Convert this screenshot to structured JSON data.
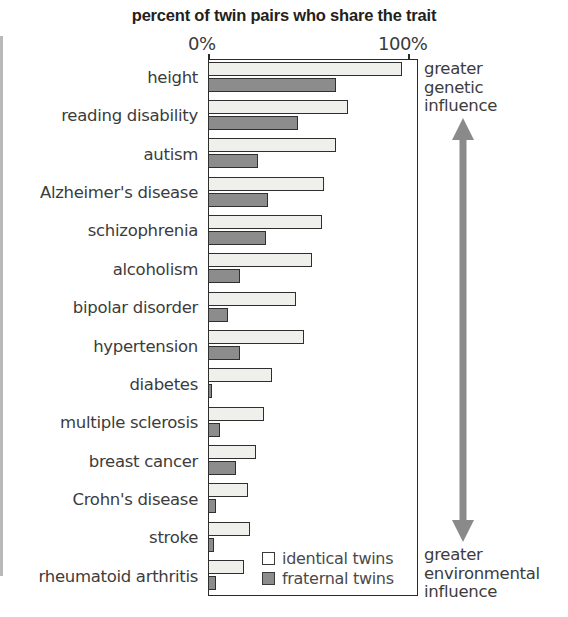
{
  "chart_data": {
    "type": "bar",
    "orientation": "horizontal",
    "title": "percent of twin pairs who share the trait",
    "xlabel": "",
    "ylabel": "",
    "xlim": [
      0,
      100
    ],
    "grid": false,
    "legend_position": "inside-bottom-right",
    "tick_labels": [
      "0%",
      "100%"
    ],
    "categories": [
      "height",
      "reading disability",
      "autism",
      "Alzheimer's disease",
      "schizophrenia",
      "alcoholism",
      "bipolar disorder",
      "hypertension",
      "diabetes",
      "multiple sclerosis",
      "breast cancer",
      "Crohn's disease",
      "stroke",
      "rheumatoid arthritis"
    ],
    "series": [
      {
        "name": "identical twins",
        "color": "#efefec",
        "values": [
          97,
          70,
          64,
          58,
          57,
          52,
          44,
          48,
          32,
          28,
          24,
          20,
          21,
          18
        ]
      },
      {
        "name": "fraternal twins",
        "color": "#8c8c8c",
        "values": [
          64,
          45,
          25,
          30,
          29,
          16,
          10,
          16,
          2,
          6,
          14,
          4,
          3,
          4
        ]
      }
    ],
    "annotations": [
      {
        "id": "top",
        "lines": [
          "greater",
          "genetic",
          "influence"
        ]
      },
      {
        "id": "bottom",
        "lines": [
          "greater",
          "environmental",
          "influence"
        ]
      }
    ]
  },
  "legend": {
    "items": [
      {
        "label": "identical twins",
        "swatch": "identical"
      },
      {
        "label": "fraternal twins",
        "swatch": "fraternal"
      }
    ]
  },
  "annotation_top": {
    "line1": "greater",
    "line2": "genetic",
    "line3": "influence"
  },
  "annotation_bottom": {
    "line1": "greater",
    "line2": "environmental",
    "line3": "influence"
  },
  "axis": {
    "tick_min": "0%",
    "tick_max": "100%"
  },
  "colors": {
    "identical_fill": "#efefec",
    "fraternal_fill": "#8c8c8c",
    "outline": "#2f2f2f",
    "arrow": "#8a8a8a",
    "text": "#3c3c3c"
  }
}
